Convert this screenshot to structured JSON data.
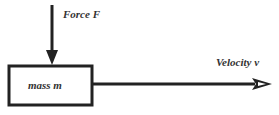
{
  "diagram": {
    "force_label": "Force F",
    "mass_label": "mass m",
    "velocity_label": "Velocity v",
    "stroke_color": "#222222"
  }
}
